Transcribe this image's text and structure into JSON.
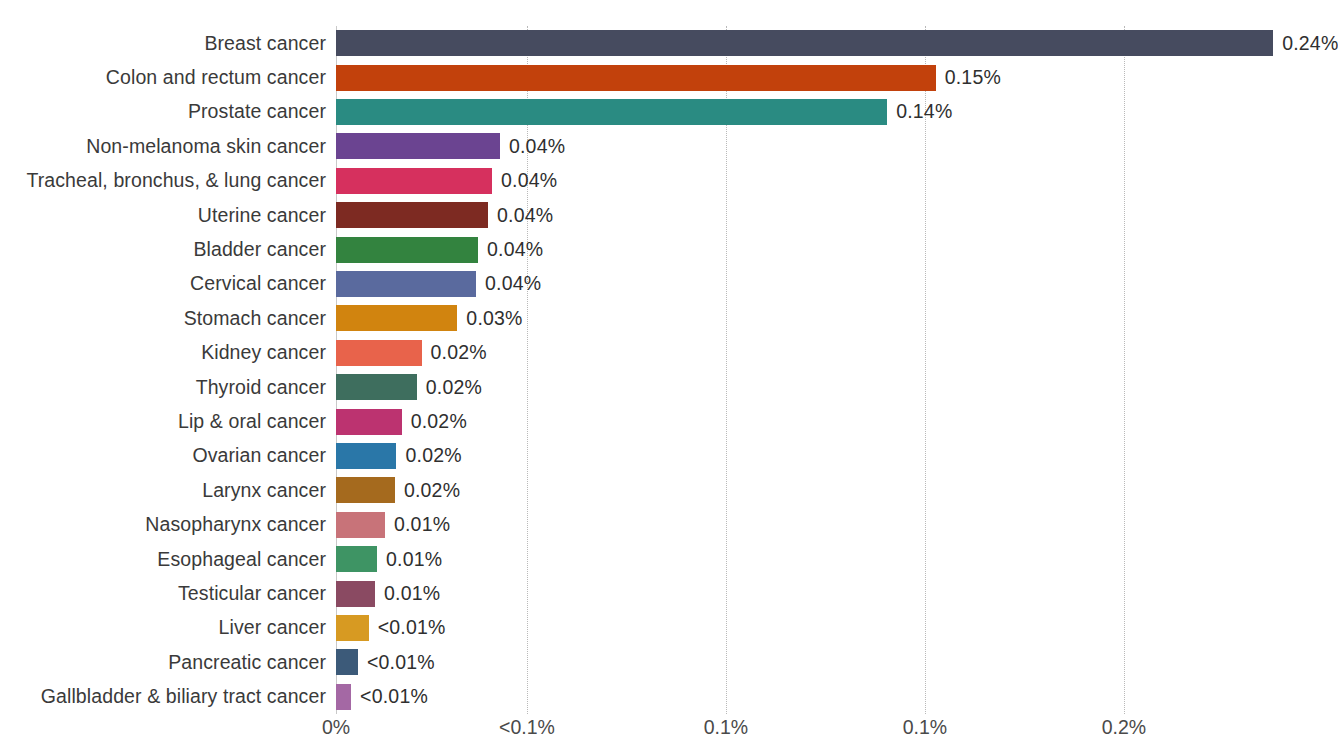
{
  "chart_data": {
    "type": "bar",
    "orientation": "horizontal",
    "title": "",
    "subtitle": "",
    "xlabel": "",
    "ylabel": "",
    "grid": true,
    "legend": "none",
    "xlim": [
      0,
      0.2435
    ],
    "x_tick_labels": [
      "0%",
      "<0.1%",
      "0.1%",
      "0.1%",
      "0.2%"
    ],
    "x_tick_values": [
      0,
      0.048,
      0.098,
      0.148,
      0.198
    ],
    "categories": [
      "Breast cancer",
      "Colon and rectum cancer",
      "Prostate cancer",
      "Non-melanoma skin cancer",
      "Tracheal, bronchus, & lung cancer",
      "Uterine cancer",
      "Bladder cancer",
      "Cervical cancer",
      "Stomach cancer",
      "Kidney cancer",
      "Thyroid cancer",
      "Lip & oral cancer",
      "Ovarian cancer",
      "Larynx cancer",
      "Nasopharynx cancer",
      "Esophageal cancer",
      "Testicular cancer",
      "Liver cancer",
      "Pancreatic cancer",
      "Gallbladder & biliary tract cancer"
    ],
    "values": [
      0.2355,
      0.1507,
      0.1385,
      0.0412,
      0.0392,
      0.0382,
      0.0357,
      0.0352,
      0.0305,
      0.0215,
      0.0203,
      0.0165,
      0.0152,
      0.0148,
      0.0123,
      0.0103,
      0.0098,
      0.0082,
      0.0055,
      0.0038
    ],
    "value_labels": [
      "0.24%",
      "0.15%",
      "0.14%",
      "0.04%",
      "0.04%",
      "0.04%",
      "0.04%",
      "0.04%",
      "0.03%",
      "0.02%",
      "0.02%",
      "0.02%",
      "0.02%",
      "0.02%",
      "0.01%",
      "0.01%",
      "0.01%",
      "<0.01%",
      "<0.01%",
      "<0.01%"
    ],
    "colors": [
      "#464b5f",
      "#c2410c",
      "#2a8b82",
      "#6b4491",
      "#d6305e",
      "#7d2a22",
      "#33833f",
      "#5a6a9e",
      "#d1840f",
      "#e8634b",
      "#3e6e5e",
      "#bc3370",
      "#2a77a8",
      "#a56a1e",
      "#c87379",
      "#3e9464",
      "#8a4a62",
      "#d79a22",
      "#3c5a79",
      "#a468a4"
    ],
    "bars": [
      {
        "category": "Breast cancer",
        "value": 0.2355,
        "label": "0.24%",
        "color": "#464b5f"
      },
      {
        "category": "Colon and rectum cancer",
        "value": 0.1507,
        "label": "0.15%",
        "color": "#c2410c"
      },
      {
        "category": "Prostate cancer",
        "value": 0.1385,
        "label": "0.14%",
        "color": "#2a8b82"
      },
      {
        "category": "Non-melanoma skin cancer",
        "value": 0.0412,
        "label": "0.04%",
        "color": "#6b4491"
      },
      {
        "category": "Tracheal, bronchus, & lung cancer",
        "value": 0.0392,
        "label": "0.04%",
        "color": "#d6305e"
      },
      {
        "category": "Uterine cancer",
        "value": 0.0382,
        "label": "0.04%",
        "color": "#7d2a22"
      },
      {
        "category": "Bladder cancer",
        "value": 0.0357,
        "label": "0.04%",
        "color": "#33833f"
      },
      {
        "category": "Cervical cancer",
        "value": 0.0352,
        "label": "0.04%",
        "color": "#5a6a9e"
      },
      {
        "category": "Stomach cancer",
        "value": 0.0305,
        "label": "0.03%",
        "color": "#d1840f"
      },
      {
        "category": "Kidney cancer",
        "value": 0.0215,
        "label": "0.02%",
        "color": "#e8634b"
      },
      {
        "category": "Thyroid cancer",
        "value": 0.0203,
        "label": "0.02%",
        "color": "#3e6e5e"
      },
      {
        "category": "Lip & oral cancer",
        "value": 0.0165,
        "label": "0.02%",
        "color": "#bc3370"
      },
      {
        "category": "Ovarian cancer",
        "value": 0.0152,
        "label": "0.02%",
        "color": "#2a77a8"
      },
      {
        "category": "Larynx cancer",
        "value": 0.0148,
        "label": "0.02%",
        "color": "#a56a1e"
      },
      {
        "category": "Nasopharynx cancer",
        "value": 0.0123,
        "label": "0.01%",
        "color": "#c87379"
      },
      {
        "category": "Esophageal cancer",
        "value": 0.0103,
        "label": "0.01%",
        "color": "#3e9464"
      },
      {
        "category": "Testicular cancer",
        "value": 0.0098,
        "label": "0.01%",
        "color": "#8a4a62"
      },
      {
        "category": "Liver cancer",
        "value": 0.0082,
        "label": "<0.01%",
        "color": "#d79a22"
      },
      {
        "category": "Pancreatic cancer",
        "value": 0.0055,
        "label": "<0.01%",
        "color": "#3c5a79"
      },
      {
        "category": "Gallbladder & biliary tract cancer",
        "value": 0.0038,
        "label": "<0.01%",
        "color": "#a468a4"
      }
    ]
  }
}
